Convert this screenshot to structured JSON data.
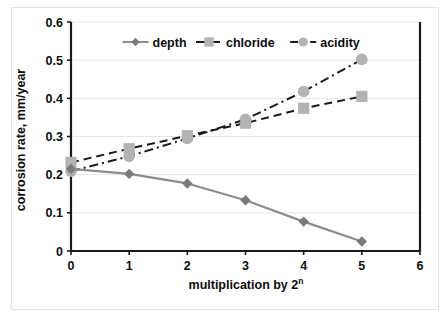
{
  "chart_data": {
    "type": "line",
    "title": "",
    "xlabel": "multiplication  by 2ⁿ",
    "xlabel_base": "multiplication  by 2",
    "xlabel_exponent": "n",
    "ylabel": "corrosion rate, mm/year",
    "x": [
      0,
      1,
      2,
      3,
      4,
      5
    ],
    "xlim": [
      0,
      6
    ],
    "ylim": [
      0,
      0.6
    ],
    "xticks": [
      "0",
      "1",
      "2",
      "3",
      "4",
      "5",
      "6"
    ],
    "yticks": [
      "0",
      "0.1",
      "0.2",
      "0.3",
      "0.4",
      "0.5",
      "0.6"
    ],
    "grid": "horizontal",
    "legend_position": "top-center-inside",
    "series": [
      {
        "name": "depth",
        "marker": "diamond",
        "line_style": "solid",
        "color": "#8c8c8c",
        "marker_color": "#7a7a7a",
        "values": [
          0.215,
          0.202,
          0.177,
          0.133,
          0.077,
          0.025
        ]
      },
      {
        "name": "chloride",
        "marker": "square",
        "line_style": "dashed",
        "color": "#1a1a1a",
        "marker_color": "#b3b3b3",
        "values": [
          0.232,
          0.268,
          0.302,
          0.335,
          0.374,
          0.405
        ]
      },
      {
        "name": "acidity",
        "marker": "circle",
        "line_style": "dash-dot",
        "color": "#1a1a1a",
        "marker_color": "#b3b3b3",
        "values": [
          0.209,
          0.248,
          0.295,
          0.345,
          0.418,
          0.502
        ]
      }
    ]
  },
  "legend": {
    "items": [
      {
        "label": "depth"
      },
      {
        "label": "chloride"
      },
      {
        "label": "acidity"
      }
    ]
  },
  "colors": {
    "axis": "#1a1a1a",
    "grid": "#e6e6e6",
    "text": "#0d0d0d",
    "frame": "#e3e3e3",
    "depth": "#8c8c8c",
    "marker_light": "#b3b3b3",
    "marker_dark": "#7a7a7a"
  }
}
